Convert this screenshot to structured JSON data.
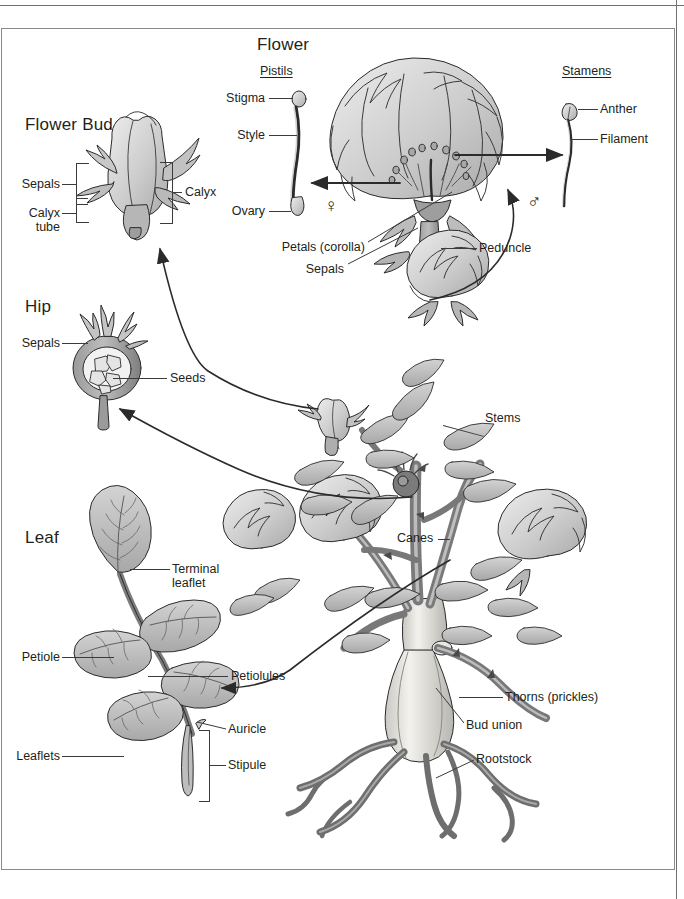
{
  "figure": {
    "sections": [
      {
        "id": "flower",
        "title": "Flower"
      },
      {
        "id": "flower_bud",
        "title": "Flower Bud"
      },
      {
        "id": "hip",
        "title": "Hip"
      },
      {
        "id": "leaf",
        "title": "Leaf"
      }
    ]
  },
  "flower": {
    "title": "Flower",
    "pistils_heading": "Pistils",
    "stamens_heading": "Stamens",
    "labels": {
      "stigma": "Stigma",
      "style": "Style",
      "ovary": "Ovary",
      "anther": "Anther",
      "filament": "Filament",
      "petals": "Petals (corolla)",
      "sepals": "Sepals",
      "peduncle": "Peduncle"
    },
    "symbols": {
      "female": "♀",
      "male": "♂"
    }
  },
  "flower_bud": {
    "title": "Flower Bud",
    "labels": {
      "sepals": "Sepals",
      "calyx_tube_line1": "Calyx",
      "calyx_tube_line2": "tube",
      "calyx": "Calyx"
    }
  },
  "hip": {
    "title": "Hip",
    "labels": {
      "sepals": "Sepals",
      "seeds": "Seeds"
    }
  },
  "leaf": {
    "title": "Leaf",
    "labels": {
      "terminal_leaflet_line1": "Terminal",
      "terminal_leaflet_line2": "leaflet",
      "petiole": "Petiole",
      "petiolules": "Petiolules",
      "auricle": "Auricle",
      "leaflets": "Leaflets",
      "stipule": "Stipule"
    }
  },
  "plant": {
    "labels": {
      "stems": "Stems",
      "canes": "Canes",
      "thorns": "Thorns (prickles)",
      "bud_union": "Bud union",
      "rootstock": "Rootstock"
    }
  },
  "colors": {
    "ink": "#231f20",
    "leader": "#3c3a3b",
    "outline": "#2b2b2b",
    "fill_light": "#e2e2e2",
    "fill_mid": "#c2c2c2",
    "fill_dark": "#a3a3a3",
    "fill_deep": "#8b8b8b",
    "rootstock": "#ececea",
    "page": "#ffffff",
    "rule": "#6f6f6f"
  }
}
